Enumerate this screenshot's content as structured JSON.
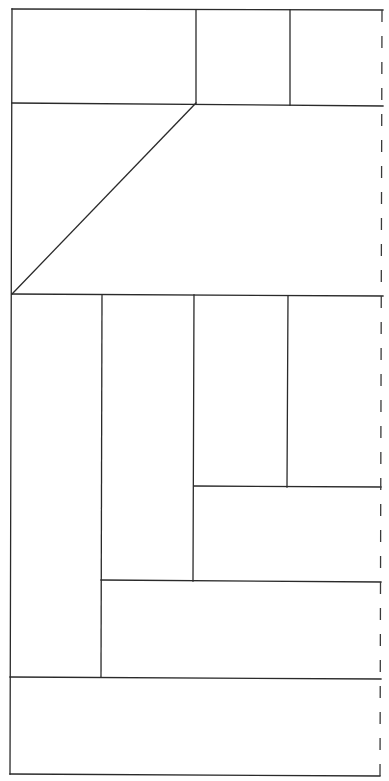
{
  "diagram": {
    "width": 389,
    "height": 781,
    "stroke_color": "#2a2a2a",
    "dashed_color": "#3a3a3a",
    "background": "#ffffff",
    "solid_lines": [
      {
        "name": "outer-top-edge",
        "x1": 12,
        "y1": 9,
        "x2": 383,
        "y2": 10
      },
      {
        "name": "outer-left-edge",
        "x1": 12,
        "y1": 9,
        "x2": 10,
        "y2": 774
      },
      {
        "name": "outer-bottom-edge",
        "x1": 10,
        "y1": 774,
        "x2": 380,
        "y2": 776
      },
      {
        "name": "top-row-divider",
        "x1": 12,
        "y1": 103,
        "x2": 383,
        "y2": 106
      },
      {
        "name": "top-vertical-1",
        "x1": 196,
        "y1": 10,
        "x2": 196,
        "y2": 103
      },
      {
        "name": "top-vertical-2",
        "x1": 290,
        "y1": 10,
        "x2": 290,
        "y2": 105
      },
      {
        "name": "diagonal",
        "x1": 196,
        "y1": 103,
        "x2": 12,
        "y2": 294
      },
      {
        "name": "middle-divider",
        "x1": 12,
        "y1": 294,
        "x2": 383,
        "y2": 296
      },
      {
        "name": "vertical-a",
        "x1": 102,
        "y1": 295,
        "x2": 101,
        "y2": 677
      },
      {
        "name": "vertical-b",
        "x1": 194,
        "y1": 295,
        "x2": 193,
        "y2": 581
      },
      {
        "name": "vertical-c",
        "x1": 288,
        "y1": 296,
        "x2": 287,
        "y2": 487
      },
      {
        "name": "horizontal-c",
        "x1": 194,
        "y1": 486,
        "x2": 381,
        "y2": 487
      },
      {
        "name": "horizontal-b",
        "x1": 101,
        "y1": 580,
        "x2": 381,
        "y2": 582
      },
      {
        "name": "horizontal-a",
        "x1": 10,
        "y1": 677,
        "x2": 381,
        "y2": 679
      }
    ],
    "dashed_lines": [
      {
        "name": "right-dashed-edge",
        "x1": 382,
        "y1": 10,
        "x2": 380,
        "y2": 776,
        "dash": "12,14"
      }
    ]
  }
}
